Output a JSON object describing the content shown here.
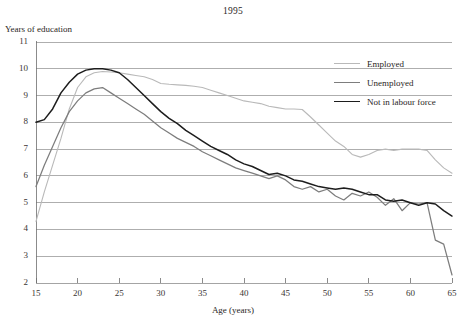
{
  "chart_data": {
    "type": "line",
    "title": "1995",
    "xlabel": "Age (years)",
    "ylabel": "Years of education",
    "xlim": [
      15,
      65
    ],
    "ylim": [
      2,
      11
    ],
    "xticks": [
      15,
      20,
      25,
      30,
      35,
      40,
      45,
      50,
      55,
      60,
      65
    ],
    "yticks": [
      2,
      3,
      4,
      5,
      6,
      7,
      8,
      9,
      10,
      11
    ],
    "grid": true,
    "legend_position": "top-right",
    "colors": {
      "employed": "#b9b9b9",
      "unemployed": "#7d7d7d",
      "not_in_labour_force": "#1d1d1d",
      "grid": "#9a9a9a",
      "axis": "#6e6e6e"
    },
    "x": [
      15,
      16,
      17,
      18,
      19,
      20,
      21,
      22,
      23,
      24,
      25,
      26,
      27,
      28,
      29,
      30,
      31,
      32,
      33,
      34,
      35,
      36,
      37,
      38,
      39,
      40,
      41,
      42,
      43,
      44,
      45,
      46,
      47,
      48,
      49,
      50,
      51,
      52,
      53,
      54,
      55,
      56,
      57,
      58,
      59,
      60,
      61,
      62,
      63,
      64,
      65
    ],
    "series": [
      {
        "name": "Employed",
        "values": [
          4.3,
          5.4,
          6.4,
          7.4,
          8.5,
          9.3,
          9.7,
          9.85,
          9.9,
          9.88,
          9.85,
          9.8,
          9.75,
          9.7,
          9.6,
          9.45,
          9.42,
          9.4,
          9.38,
          9.35,
          9.3,
          9.2,
          9.1,
          9.0,
          8.9,
          8.8,
          8.75,
          8.7,
          8.6,
          8.55,
          8.5,
          8.5,
          8.48,
          8.2,
          7.9,
          7.6,
          7.3,
          7.1,
          6.8,
          6.7,
          6.8,
          6.95,
          7.0,
          6.95,
          7.0,
          7.0,
          7.0,
          6.95,
          6.6,
          6.3,
          6.1
        ]
      },
      {
        "name": "Unemployed",
        "values": [
          5.6,
          6.4,
          7.1,
          7.8,
          8.4,
          8.8,
          9.1,
          9.25,
          9.3,
          9.1,
          8.9,
          8.7,
          8.5,
          8.3,
          8.05,
          7.8,
          7.6,
          7.4,
          7.25,
          7.1,
          6.9,
          6.75,
          6.6,
          6.45,
          6.3,
          6.2,
          6.1,
          6.0,
          5.9,
          6.0,
          5.85,
          5.6,
          5.5,
          5.6,
          5.4,
          5.5,
          5.25,
          5.1,
          5.35,
          5.25,
          5.4,
          5.2,
          4.9,
          5.15,
          4.7,
          5.0,
          4.95,
          5.0,
          3.6,
          3.45,
          2.3
        ]
      },
      {
        "name": "Not in labour force",
        "values": [
          8.0,
          8.1,
          8.5,
          9.1,
          9.5,
          9.8,
          9.95,
          10.0,
          10.0,
          9.95,
          9.85,
          9.6,
          9.3,
          9.0,
          8.7,
          8.4,
          8.15,
          7.95,
          7.7,
          7.5,
          7.3,
          7.1,
          6.95,
          6.8,
          6.6,
          6.45,
          6.35,
          6.2,
          6.05,
          6.1,
          6.0,
          5.85,
          5.8,
          5.7,
          5.6,
          5.55,
          5.5,
          5.55,
          5.5,
          5.4,
          5.3,
          5.3,
          5.1,
          5.05,
          5.1,
          5.0,
          4.9,
          5.0,
          4.95,
          4.7,
          4.5
        ]
      }
    ]
  },
  "legend": {
    "items": [
      {
        "label": "Employed",
        "color": "#b9b9b9",
        "width": 1.1
      },
      {
        "label": "Unemployed",
        "color": "#7d7d7d",
        "width": 1.3
      },
      {
        "label": "Not in labour force",
        "color": "#1d1d1d",
        "width": 1.6
      }
    ]
  }
}
